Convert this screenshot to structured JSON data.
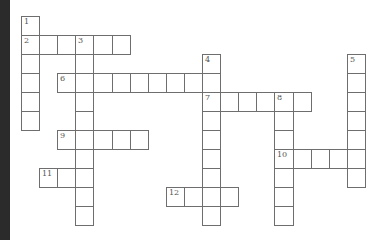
{
  "puzzle": {
    "type": "crossword",
    "grid": {
      "origin_x": 21,
      "origin_y": 16,
      "cell_w": 18.1,
      "cell_h": 19
    },
    "words": [
      {
        "number": "1",
        "direction": "down",
        "row": 0,
        "col": 0,
        "length": 6
      },
      {
        "number": "2",
        "direction": "across",
        "row": 1,
        "col": 0,
        "length": 6
      },
      {
        "number": "3",
        "direction": "down",
        "row": 1,
        "col": 3,
        "length": 10
      },
      {
        "number": "4",
        "direction": "down",
        "row": 2,
        "col": 10,
        "length": 9
      },
      {
        "number": "5",
        "direction": "down",
        "row": 2,
        "col": 18,
        "length": 7
      },
      {
        "number": "6",
        "direction": "across",
        "row": 3,
        "col": 2,
        "length": 8
      },
      {
        "number": "7",
        "direction": "across",
        "row": 4,
        "col": 10,
        "length": 6
      },
      {
        "number": "8",
        "direction": "down",
        "row": 4,
        "col": 14,
        "length": 7
      },
      {
        "number": "9",
        "direction": "across",
        "row": 6,
        "col": 2,
        "length": 5
      },
      {
        "number": "10",
        "direction": "across",
        "row": 7,
        "col": 14,
        "length": 5
      },
      {
        "number": "11",
        "direction": "across",
        "row": 8,
        "col": 1,
        "length": 3
      },
      {
        "number": "12",
        "direction": "across",
        "row": 9,
        "col": 8,
        "length": 4
      }
    ]
  }
}
